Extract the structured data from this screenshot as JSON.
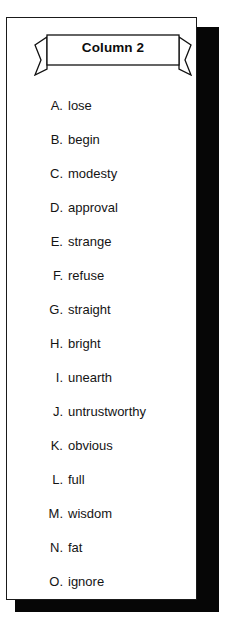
{
  "card": {
    "border_color": "#1a1a1a",
    "background": "#ffffff",
    "shadow_color": "#060606"
  },
  "banner": {
    "title": "Column 2",
    "fill": "#ffffff",
    "stroke": "#111111"
  },
  "list": {
    "items": [
      {
        "letter": "A.",
        "text": "lose"
      },
      {
        "letter": "B.",
        "text": "begin"
      },
      {
        "letter": "C.",
        "text": "modesty"
      },
      {
        "letter": "D.",
        "text": "approval"
      },
      {
        "letter": "E.",
        "text": "strange"
      },
      {
        "letter": "F.",
        "text": "refuse"
      },
      {
        "letter": "G.",
        "text": "straight"
      },
      {
        "letter": "H.",
        "text": "bright"
      },
      {
        "letter": "I.",
        "text": "unearth"
      },
      {
        "letter": "J.",
        "text": "untrustworthy"
      },
      {
        "letter": "K.",
        "text": "obvious"
      },
      {
        "letter": "L.",
        "text": "full"
      },
      {
        "letter": "M.",
        "text": "wisdom"
      },
      {
        "letter": "N.",
        "text": "fat"
      },
      {
        "letter": "O.",
        "text": "ignore"
      }
    ]
  }
}
